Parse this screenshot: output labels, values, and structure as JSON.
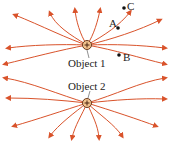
{
  "diagram": {
    "line_color": "#d9532b",
    "objects": [
      {
        "id": "object1",
        "label": "Object 1",
        "sign": "+",
        "x": 87,
        "y": 45
      },
      {
        "id": "object2",
        "label": "Object 2",
        "sign": "+",
        "x": 87,
        "y": 103
      }
    ],
    "points": [
      {
        "label": "A",
        "x": 118,
        "y": 28
      },
      {
        "label": "B",
        "x": 119,
        "y": 55
      },
      {
        "label": "C",
        "x": 124,
        "y": 8
      }
    ]
  }
}
